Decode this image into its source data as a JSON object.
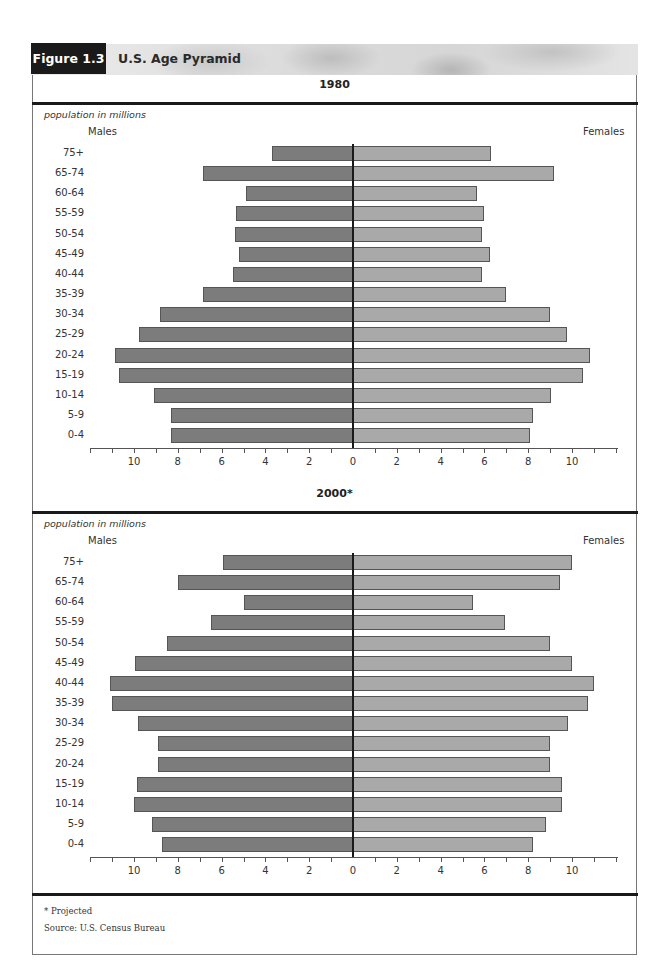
{
  "figure": {
    "label": "Figure 1.3",
    "title": "U.S. Age Pyramid",
    "footnote_projected": "* Projected",
    "source": "Source: U.S. Census Bureau"
  },
  "colors": {
    "male_bar": "#7c7c7c",
    "female_bar": "#a9a9a9",
    "center_line": "#1a1a1a",
    "label_box": "#1a1a1a"
  },
  "panels": [
    {
      "title": "1980",
      "units": "population in millions",
      "males_label": "Males",
      "females_label": "Females"
    },
    {
      "title": "2000*",
      "units": "population in millions",
      "males_label": "Males",
      "females_label": "Females"
    }
  ],
  "axis": {
    "ticks_left": [
      "10",
      "8",
      "6",
      "4",
      "2"
    ],
    "zero": "0",
    "ticks_right": [
      "2",
      "4",
      "6",
      "8",
      "10"
    ]
  },
  "chart_data": [
    {
      "type": "bar",
      "orientation": "horizontal-pyramid",
      "title": "1980",
      "xlabel": "population in millions",
      "ylabel": "",
      "categories": [
        "75+",
        "65-74",
        "60-64",
        "55-59",
        "50-54",
        "45-49",
        "40-44",
        "35-39",
        "30-34",
        "25-29",
        "20-24",
        "15-19",
        "10-14",
        "5-9",
        "0-4"
      ],
      "series": [
        {
          "name": "Males",
          "values": [
            3.7,
            6.85,
            4.9,
            5.35,
            5.4,
            5.2,
            5.5,
            6.85,
            8.8,
            9.75,
            10.85,
            10.7,
            9.1,
            8.3,
            8.3
          ]
        },
        {
          "name": "Females",
          "values": [
            6.3,
            9.2,
            5.65,
            6.0,
            5.9,
            6.25,
            5.9,
            7.0,
            9.0,
            9.75,
            10.8,
            10.5,
            9.05,
            8.2,
            8.1
          ]
        }
      ],
      "xlim": [
        -12,
        12
      ],
      "x_tick_labels": [
        "10",
        "8",
        "6",
        "4",
        "2",
        "0",
        "2",
        "4",
        "6",
        "8",
        "10"
      ],
      "grid": false,
      "legend": "Males (left), Females (right)"
    },
    {
      "type": "bar",
      "orientation": "horizontal-pyramid",
      "title": "2000*",
      "xlabel": "population in millions",
      "ylabel": "",
      "categories": [
        "75+",
        "65-74",
        "60-64",
        "55-59",
        "50-54",
        "45-49",
        "40-44",
        "35-39",
        "30-34",
        "25-29",
        "20-24",
        "15-19",
        "10-14",
        "5-9",
        "0-4"
      ],
      "series": [
        {
          "name": "Males",
          "values": [
            5.95,
            8.0,
            5.0,
            6.5,
            8.5,
            9.95,
            11.1,
            11.0,
            9.8,
            8.9,
            8.9,
            9.85,
            10.0,
            9.2,
            8.7
          ]
        },
        {
          "name": "Females",
          "values": [
            10.0,
            9.45,
            5.5,
            6.95,
            9.0,
            10.0,
            11.0,
            10.75,
            9.8,
            9.0,
            9.0,
            9.55,
            9.55,
            8.8,
            8.2
          ]
        }
      ],
      "xlim": [
        -12,
        12
      ],
      "x_tick_labels": [
        "10",
        "8",
        "6",
        "4",
        "2",
        "0",
        "2",
        "4",
        "6",
        "8",
        "10"
      ],
      "grid": false,
      "legend": "Males (left), Females (right)",
      "annotation": "* Projected"
    }
  ]
}
